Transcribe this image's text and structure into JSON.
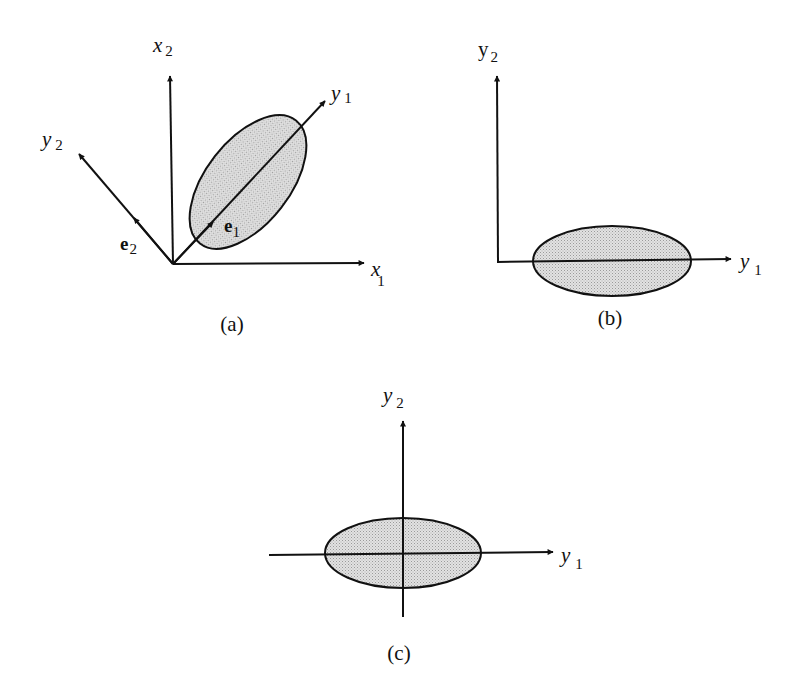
{
  "panels": {
    "a": {
      "caption": "(a)",
      "axes": {
        "x1": {
          "label": "x",
          "sub": "1"
        },
        "x2": {
          "label": "x",
          "sub": "2"
        },
        "y1": {
          "label": "y",
          "sub": "1"
        },
        "y2": {
          "label": "y",
          "sub": "2"
        }
      },
      "vectors": {
        "e1": {
          "label": "e",
          "sub": "1"
        },
        "e2": {
          "label": "e",
          "sub": "2"
        }
      }
    },
    "b": {
      "caption": "(b)",
      "axes": {
        "y1": {
          "label": "y",
          "sub": "1"
        },
        "y2": {
          "label": "y",
          "sub": "2"
        }
      }
    },
    "c": {
      "caption": "(c)",
      "axes": {
        "y1": {
          "label": "y",
          "sub": "1"
        },
        "y2": {
          "label": "y",
          "sub": "2"
        }
      }
    }
  },
  "colors": {
    "ellipse_fill": "#d4d4d4",
    "stroke": "#111111"
  }
}
